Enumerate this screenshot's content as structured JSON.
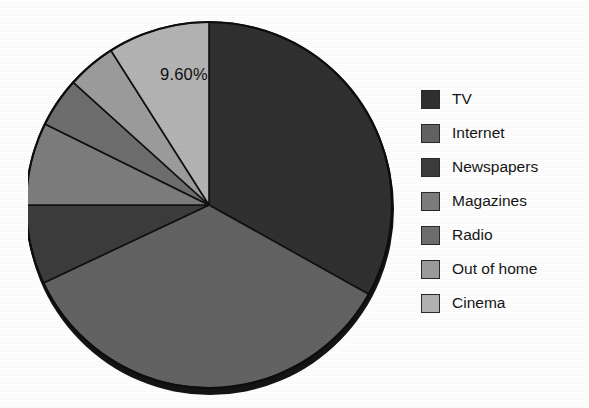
{
  "chart_data": {
    "type": "pie",
    "title": "",
    "subtitle": "",
    "xlabel": "",
    "ylabel": "",
    "grid": false,
    "legend_position": "right",
    "start_angle_deg": 0,
    "direction": "clockwise",
    "categories": [
      "TV",
      "Internet",
      "Newspapers",
      "Magazines",
      "Radio",
      "Out of home",
      "Cinema"
    ],
    "values": [
      33.1,
      34.9,
      7.0,
      7.3,
      4.4,
      4.3,
      9.6
    ],
    "value_unit": "%",
    "labels_shown": [
      "9.60%"
    ],
    "slices": [
      {
        "name": "TV",
        "value": 33.1,
        "color": "#303030",
        "start_deg": 0.0,
        "end_deg": 119.2,
        "label": ""
      },
      {
        "name": "Internet",
        "value": 34.9,
        "color": "#636363",
        "start_deg": 119.2,
        "end_deg": 244.8,
        "label": ""
      },
      {
        "name": "Newspapers",
        "value": 7.0,
        "color": "#3c3c3c",
        "start_deg": 244.8,
        "end_deg": 270.0,
        "label": ""
      },
      {
        "name": "Magazines",
        "value": 7.3,
        "color": "#7d7d7d",
        "start_deg": 270.0,
        "end_deg": 296.3,
        "label": ""
      },
      {
        "name": "Radio",
        "value": 4.4,
        "color": "#6e6e6e",
        "start_deg": 296.3,
        "end_deg": 312.1,
        "label": ""
      },
      {
        "name": "Out of home",
        "value": 4.3,
        "color": "#9c9c9c",
        "start_deg": 312.1,
        "end_deg": 327.6,
        "label": ""
      },
      {
        "name": "Cinema",
        "value": 9.6,
        "color": "#b4b4b4",
        "start_deg": 327.6,
        "end_deg": 360.0,
        "label": "9.60%"
      }
    ],
    "annotations": [
      {
        "text": "9.60%",
        "target": "Cinema",
        "x": 160,
        "y": 66
      }
    ]
  },
  "legend": {
    "items": [
      {
        "label": "TV",
        "color": "#303030",
        "swatch_name": "legend-swatch-tv"
      },
      {
        "label": "Internet",
        "color": "#636363",
        "swatch_name": "legend-swatch-internet"
      },
      {
        "label": "Newspapers",
        "color": "#3c3c3c",
        "swatch_name": "legend-swatch-newspapers"
      },
      {
        "label": "Magazines",
        "color": "#7d7d7d",
        "swatch_name": "legend-swatch-magazines"
      },
      {
        "label": "Radio",
        "color": "#6e6e6e",
        "swatch_name": "legend-swatch-radio"
      },
      {
        "label": "Out of home",
        "color": "#9c9c9c",
        "swatch_name": "legend-swatch-out-of-home"
      },
      {
        "label": "Cinema",
        "color": "#b4b4b4",
        "swatch_name": "legend-swatch-cinema"
      }
    ]
  },
  "colors": {
    "background": "#ffffff",
    "slice_border": "#111111",
    "text": "#161616"
  }
}
